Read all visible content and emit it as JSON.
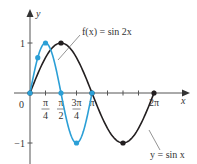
{
  "chart_data": {
    "type": "line",
    "title": "",
    "xlabel": "x",
    "ylabel": "y",
    "xlim": [
      0,
      6.6
    ],
    "ylim": [
      -1.15,
      1.3
    ],
    "grid": false,
    "x_ticks": [
      {
        "value": 0.7854,
        "label_num": "π",
        "label_den": "4"
      },
      {
        "value": 1.5708,
        "label_num": "π",
        "label_den": "2"
      },
      {
        "value": 2.3562,
        "label_num": "3π",
        "label_den": "4"
      },
      {
        "value": 3.1416,
        "label": "π"
      },
      {
        "value": 3.927,
        "label": ""
      },
      {
        "value": 4.7124,
        "label": ""
      },
      {
        "value": 5.4978,
        "label": ""
      },
      {
        "value": 6.2832,
        "label": "2π"
      }
    ],
    "origin_label": "0",
    "y_ticks": [
      {
        "value": 1,
        "label": "1"
      },
      {
        "value": -1,
        "label": "−1"
      }
    ],
    "series": [
      {
        "name": "y = sin x",
        "function": "sin(x)",
        "domain": [
          0,
          6.2832
        ],
        "color": "#231f20",
        "points": [
          {
            "x": 0,
            "y": 0
          },
          {
            "x": 1.5708,
            "y": 1
          },
          {
            "x": 3.1416,
            "y": 0
          },
          {
            "x": 4.7124,
            "y": -1
          },
          {
            "x": 6.2832,
            "y": 0
          }
        ]
      },
      {
        "name": "f(x) = sin 2x",
        "function": "sin(2x)",
        "domain": [
          0,
          3.1416
        ],
        "color": "#2b9fd6",
        "points": [
          {
            "x": 0,
            "y": 0
          },
          {
            "x": 0.3927,
            "y": 0.7071
          },
          {
            "x": 0.7854,
            "y": 1
          },
          {
            "x": 1.5708,
            "y": 0
          },
          {
            "x": 2.3562,
            "y": -1
          },
          {
            "x": 3.1416,
            "y": 0
          }
        ]
      }
    ],
    "annotations": [
      {
        "text": "f(x) = sin 2x",
        "target_series": "f(x) = sin 2x"
      },
      {
        "text": "y = sin x",
        "target_series": "y = sin x"
      }
    ]
  },
  "labels": {
    "x_axis": "x",
    "y_axis": "y",
    "origin": "0",
    "fx_label": "f(x) = sin 2x",
    "sin_label": "y = sin x"
  }
}
